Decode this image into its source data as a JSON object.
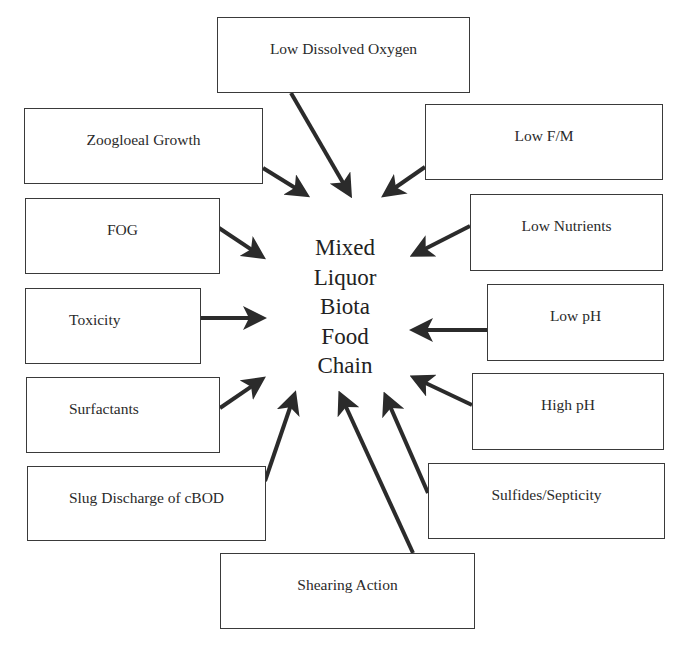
{
  "diagram": {
    "center": {
      "lines": [
        "Mixed",
        "Liquor",
        "Biota",
        "Food",
        "Chain"
      ]
    },
    "factors": [
      {
        "id": "low-dissolved-oxygen",
        "label": "Low Dissolved Oxygen"
      },
      {
        "id": "zoogloeal-growth",
        "label": "Zoogloeal Growth"
      },
      {
        "id": "low-f-m",
        "label": "Low F/M"
      },
      {
        "id": "fog",
        "label": "FOG"
      },
      {
        "id": "low-nutrients",
        "label": "Low Nutrients"
      },
      {
        "id": "toxicity",
        "label": "Toxicity"
      },
      {
        "id": "low-ph",
        "label": "Low pH"
      },
      {
        "id": "surfactants",
        "label": "Surfactants"
      },
      {
        "id": "high-ph",
        "label": "High pH"
      },
      {
        "id": "slug-discharge",
        "label": "Slug Discharge of cBOD"
      },
      {
        "id": "sulfides-septicity",
        "label": "Sulfides/Septicity"
      },
      {
        "id": "shearing-action",
        "label": "Shearing Action"
      }
    ],
    "arrow_color": "#2b2b2b"
  }
}
